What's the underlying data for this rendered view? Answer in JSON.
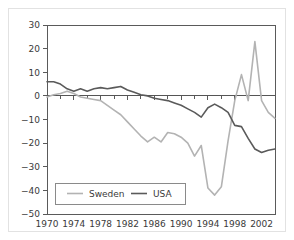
{
  "chart_data": {
    "type": "line",
    "title": "",
    "subtitle": "",
    "xlabel": "",
    "ylabel": "",
    "xlim": [
      1970,
      2004
    ],
    "ylim": [
      -50,
      30
    ],
    "grid": false,
    "zero_line": true,
    "legend_position": "bottom-left",
    "x_ticks": [
      1970,
      1974,
      1978,
      1982,
      1986,
      1990,
      1994,
      1998,
      2002
    ],
    "x_tick_labels": [
      "1970",
      "1974",
      "1978",
      "1982",
      "1986",
      "1990",
      "1994",
      "1998",
      "2002"
    ],
    "x_minor_ticks": [
      1972,
      1976,
      1980,
      1984,
      1988,
      1992,
      1996,
      2000,
      2004
    ],
    "y_ticks": [
      30,
      20,
      10,
      0,
      -10,
      -20,
      -30,
      -40,
      -50
    ],
    "y_tick_labels": [
      "30",
      "20",
      "10",
      "0",
      "−10",
      "−20",
      "−30",
      "−40",
      "−50"
    ],
    "x": [
      1970,
      1971,
      1972,
      1973,
      1974,
      1975,
      1976,
      1977,
      1978,
      1979,
      1980,
      1981,
      1982,
      1983,
      1984,
      1985,
      1986,
      1987,
      1988,
      1989,
      1990,
      1991,
      1992,
      1993,
      1994,
      1995,
      1996,
      1997,
      1998,
      1999,
      2000,
      2001,
      2002,
      2003,
      2004
    ],
    "series": [
      {
        "name": "Sweden",
        "color": "#b3b3b3",
        "width": 1.6,
        "values": [
          -0.5,
          0.5,
          1.0,
          2.0,
          1.0,
          -0.5,
          -1.0,
          -1.5,
          -2.0,
          -4.0,
          -6.0,
          -8.0,
          -11.0,
          -14.0,
          -17.0,
          -19.5,
          -17.5,
          -19.5,
          -15.5,
          -16.0,
          -17.5,
          -20.0,
          -25.5,
          -21.0,
          -39.0,
          -42.0,
          -38.5,
          -19.0,
          -2.0,
          9.0,
          -2.0,
          23.0,
          -2.0,
          -7.0,
          -9.5
        ]
      },
      {
        "name": "USA",
        "color": "#5a5a5a",
        "width": 1.6,
        "values": [
          6.0,
          6.0,
          5.0,
          3.0,
          2.0,
          3.0,
          2.0,
          3.0,
          3.5,
          3.0,
          3.5,
          4.0,
          2.5,
          1.5,
          0.5,
          0.0,
          -1.0,
          -1.5,
          -2.0,
          -3.0,
          -4.0,
          -5.5,
          -7.0,
          -9.0,
          -5.0,
          -3.5,
          -5.0,
          -7.0,
          -12.5,
          -13.0,
          -18.0,
          -22.5,
          -24.0,
          -23.0,
          -22.5
        ]
      }
    ],
    "legend": [
      {
        "name": "Sweden",
        "color": "#b3b3b3"
      },
      {
        "name": "USA",
        "color": "#5a5a5a"
      }
    ]
  }
}
